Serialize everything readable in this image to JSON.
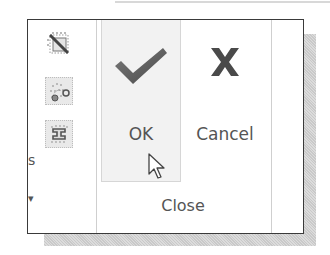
{
  "ribbon": {
    "left_column": {
      "icons": [
        {
          "name": "diagonal-grid-icon"
        },
        {
          "name": "scatter-nodes-icon",
          "selected": true
        },
        {
          "name": "i-beam-constraint-icon",
          "selected": true
        }
      ],
      "edge_text_1": "s",
      "edge_text_2": "▾"
    },
    "close_group": {
      "label": "Close",
      "buttons": [
        {
          "id": "ok",
          "label": "OK",
          "icon": "checkmark-icon",
          "hovered": true
        },
        {
          "id": "cancel",
          "label": "Cancel",
          "icon": "x-icon"
        }
      ]
    }
  },
  "colors": {
    "icon_dark": "#555555",
    "border": "#3a3a3a",
    "hover_bg": "#f2f2f2",
    "shadow": "#c9c9c9"
  },
  "cursor": {
    "type": "arrow-pointer"
  }
}
